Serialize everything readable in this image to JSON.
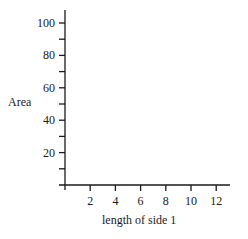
{
  "chart_data": {
    "type": "line",
    "title": "",
    "xlabel": "length of side 1",
    "ylabel": "Area",
    "xlim": [
      0,
      13.2
    ],
    "ylim": [
      0,
      108
    ],
    "x_ticks": [
      2,
      4,
      6,
      8,
      10,
      12
    ],
    "x_minor_ticks": [
      0,
      2,
      4,
      6,
      8,
      10,
      12
    ],
    "y_ticks": [
      20,
      40,
      60,
      80,
      100
    ],
    "y_minor_ticks": [
      10,
      30,
      50,
      70,
      90
    ],
    "x_tick_labels": [
      "2",
      "4",
      "6",
      "8",
      "10",
      "12"
    ],
    "y_tick_labels": [
      "20",
      "40",
      "60",
      "80",
      "100"
    ],
    "series": [],
    "grid": false,
    "legend": null,
    "note": "Empty axes with no plotted data"
  },
  "axes": {
    "origin_px": [
      65,
      185
    ],
    "x_px_per_unit": 12.6,
    "y_px_per_unit": 1.62,
    "x_end_px": 230,
    "y_end_px": 10,
    "color": "#1a1a1a"
  }
}
